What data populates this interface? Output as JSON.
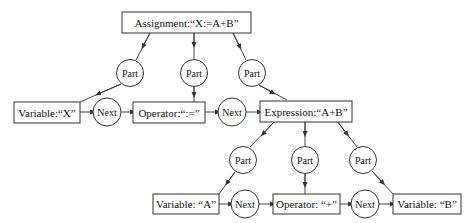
{
  "diagram": {
    "nodes": {
      "assignment": "Assignment:“X:=A+B”",
      "variable_x": "Variable:“X”",
      "operator_assign": "Operator:“:=”",
      "expression": "Expression:“A+B”",
      "variable_a": "Variable: “A”",
      "operator_plus": "Operator: “+”",
      "variable_b": "Variable: “B”"
    },
    "relations": {
      "part": "Part",
      "next": "Next"
    },
    "edges": [
      {
        "from": "assignment",
        "via": "Part",
        "to": "variable_x"
      },
      {
        "from": "assignment",
        "via": "Part",
        "to": "operator_assign"
      },
      {
        "from": "assignment",
        "via": "Part",
        "to": "expression"
      },
      {
        "from": "variable_x",
        "via": "Next",
        "to": "operator_assign"
      },
      {
        "from": "operator_assign",
        "via": "Next",
        "to": "expression"
      },
      {
        "from": "expression",
        "via": "Part",
        "to": "variable_a"
      },
      {
        "from": "expression",
        "via": "Part",
        "to": "operator_plus"
      },
      {
        "from": "expression",
        "via": "Part",
        "to": "variable_b"
      },
      {
        "from": "variable_a",
        "via": "Next",
        "to": "operator_plus"
      },
      {
        "from": "operator_plus",
        "via": "Next",
        "to": "variable_b"
      }
    ]
  }
}
